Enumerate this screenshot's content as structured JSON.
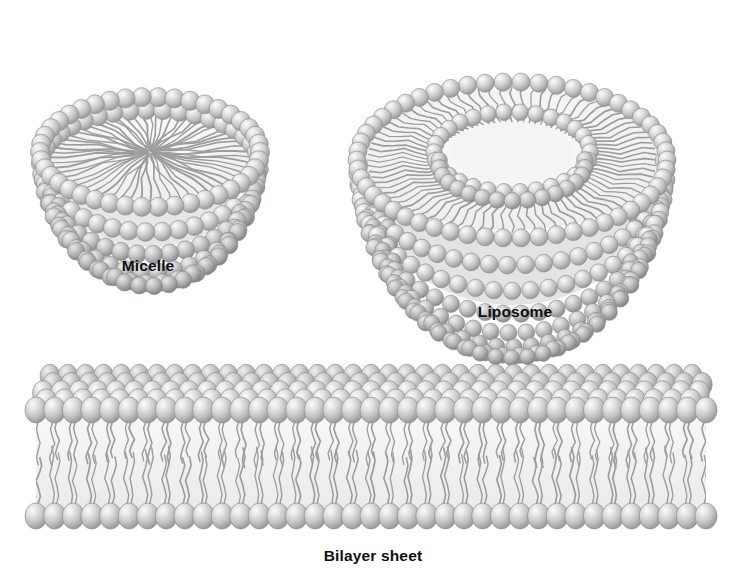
{
  "figure": {
    "background_color": "#ffffff",
    "width": 739,
    "height": 585
  },
  "palette": {
    "head_fill": "#b9bbbd",
    "head_light": "#f2f3f4",
    "head_mid": "#c8cacc",
    "head_dark": "#8e9092",
    "head_stroke": "#8d8f91",
    "tail_stroke": "#9a9c9e",
    "tail_stroke_dark": "#7f8183",
    "interior_fill": "#f4f5f6",
    "label_color": "#101010"
  },
  "labels": {
    "micelle": "Micelle",
    "liposome": "Liposome",
    "bilayer": "Bilayer sheet"
  },
  "structures": [
    {
      "id": "micelle",
      "name": "Micelle",
      "description": "Cut-away bowl of a single lipid monolayer; polar head groups face outward, hydrophobic tails converge radially to the centre.",
      "label": "Micelle",
      "label_x": 148,
      "label_y": 258,
      "center_x": 150,
      "center_y": 152,
      "rim_rx": 110,
      "rim_ry": 55,
      "bowl_depth": 92,
      "head_radius": 9.5,
      "rim_head_count": 42,
      "tail_count": 60,
      "layers": 1
    },
    {
      "id": "liposome",
      "name": "Liposome",
      "description": "Cut-away bowl of a lipid bilayer vesicle; outer and inner leaflets of head groups enclose a hydrophobic tail region and an inner aqueous compartment.",
      "label": "Liposome",
      "label_x": 515,
      "label_y": 304,
      "center_x": 512,
      "center_y": 160,
      "outer_rx": 155,
      "outer_ry": 78,
      "inner_rx": 78,
      "inner_ry": 40,
      "bowl_depth": 140,
      "head_radius": 9.0,
      "outer_head_count": 54,
      "inner_head_count": 30,
      "tail_count": 80,
      "layers": 2
    },
    {
      "id": "bilayer",
      "name": "Bilayer sheet",
      "description": "Planar lipid bilayer drawn in perspective; two opposed leaflets of head groups with interdigitating hydrocarbon tails between them.",
      "label": "Bilayer sheet",
      "label_x": 373,
      "label_y": 548,
      "left_x": 36,
      "right_x": 706,
      "top_y": 372,
      "bottom_y": 530,
      "head_radius_x": 11,
      "head_radius_y": 13,
      "columns": 37,
      "perspective_rows": 5,
      "tail_count_per_leaflet": 37
    }
  ]
}
